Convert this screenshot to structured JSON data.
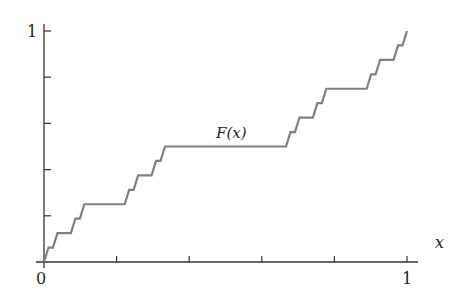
{
  "chart_data": {
    "type": "line",
    "title": "",
    "function_label": "F(x)",
    "xlabel": "x",
    "ylabel": "",
    "xlim": [
      0,
      1
    ],
    "ylim": [
      0,
      1
    ],
    "x_ticks": [
      0,
      0.2,
      0.4,
      0.6,
      0.8,
      1
    ],
    "y_ticks": [
      0.2,
      0.4,
      0.6,
      0.8,
      1
    ],
    "x_tick_labels": {
      "0": "0",
      "1": "1"
    },
    "y_tick_labels": {
      "1": "1"
    },
    "grid": false,
    "legend": "none",
    "line_color": "#808080",
    "axis_color": "#333333",
    "cantor_depth": 4
  },
  "labels": {
    "origin": "0",
    "x_one": "1",
    "y_one": "1",
    "x_axis": "x",
    "curve": "F(x)"
  }
}
